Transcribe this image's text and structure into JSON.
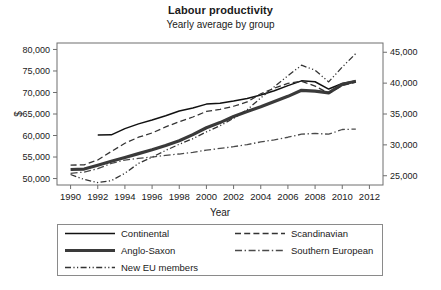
{
  "chart_data": {
    "type": "line",
    "title": "Labour productivity",
    "subtitle": "Yearly average by group",
    "xlabel": "Year",
    "ylabel": "$",
    "grid": false,
    "legend_position": "bottom",
    "xlim": [
      1989,
      2013
    ],
    "xticks": [
      1990,
      1992,
      1994,
      1996,
      1998,
      2000,
      2002,
      2004,
      2006,
      2008,
      2010,
      2012
    ],
    "xtick_labels": [
      "1990",
      "1992",
      "1994",
      "1996",
      "1998",
      "2000",
      "2002",
      "2004",
      "2006",
      "2008",
      "2010",
      "2012"
    ],
    "left_axis": {
      "label": "$",
      "ylim": [
        48500,
        81500
      ],
      "yticks": [
        50000,
        55000,
        60000,
        65000,
        70000,
        75000,
        80000
      ],
      "ytick_labels": [
        "50,000",
        "55,000",
        "60,000",
        "65,000",
        "70,000",
        "75,000",
        "80,000"
      ]
    },
    "right_axis": {
      "ylim": [
        23500,
        46500
      ],
      "yticks": [
        25000,
        30000,
        35000,
        40000,
        45000
      ],
      "ytick_labels": [
        "25,000",
        "30,000",
        "35,000",
        "40,000",
        "45,000"
      ]
    },
    "series": [
      {
        "name": "Continental",
        "axis": "left",
        "style": "solid",
        "width": 1.5,
        "color": "#111111",
        "x": [
          1992,
          1993,
          1994,
          1995,
          1996,
          1997,
          1998,
          1999,
          2000,
          2001,
          2002,
          2003,
          2004,
          2005,
          2006,
          2007,
          2008,
          2009,
          2010,
          2011
        ],
        "values": [
          60100,
          60150,
          61600,
          62700,
          63600,
          64600,
          65700,
          66400,
          67300,
          67500,
          68000,
          68600,
          69400,
          70400,
          71600,
          72700,
          72500,
          70800,
          72100,
          72700
        ]
      },
      {
        "name": "Anglo-Saxon",
        "axis": "left",
        "style": "solid",
        "width": 3.2,
        "color": "#3a3a3a",
        "x": [
          1990,
          1991,
          1992,
          1993,
          1994,
          1995,
          1996,
          1997,
          1998,
          1999,
          2000,
          2001,
          2002,
          2003,
          2004,
          2005,
          2006,
          2007,
          2008,
          2009,
          2010,
          2011
        ],
        "values": [
          52100,
          52200,
          53100,
          54000,
          54900,
          55800,
          56700,
          57700,
          58800,
          60200,
          61800,
          63000,
          64400,
          65600,
          66700,
          67900,
          69100,
          70500,
          70300,
          69900,
          71900,
          72600
        ]
      },
      {
        "name": "New EU members",
        "axis": "right",
        "style": "dash-dot-dot",
        "width": 1.3,
        "color": "#333333",
        "x": [
          1990,
          1991,
          1992,
          1993,
          1994,
          1995,
          1996,
          1997,
          1998,
          1999,
          2000,
          2001,
          2002,
          2003,
          2004,
          2005,
          2006,
          2007,
          2008,
          2009,
          2010,
          2011
        ],
        "values": [
          25200,
          24400,
          23900,
          24200,
          25400,
          27000,
          28000,
          29100,
          30100,
          31000,
          32100,
          33100,
          34300,
          35700,
          37600,
          39400,
          41200,
          42900,
          42100,
          40200,
          42600,
          44800
        ]
      },
      {
        "name": "Scandinavian",
        "axis": "left",
        "style": "dashed",
        "width": 1.3,
        "color": "#333333",
        "x": [
          1990,
          1991,
          1992,
          1993,
          1994,
          1995,
          1996,
          1997,
          1998,
          1999,
          2000,
          2001,
          2002,
          2003,
          2004,
          2005,
          2006,
          2007,
          2008,
          2009,
          2010,
          2011
        ],
        "values": [
          53100,
          53200,
          54300,
          56300,
          58200,
          59600,
          60600,
          62000,
          63200,
          64300,
          65600,
          66100,
          66800,
          67800,
          69700,
          71000,
          72100,
          72600,
          71500,
          69800,
          71600,
          72400
        ]
      },
      {
        "name": "Southern European",
        "axis": "left",
        "style": "dash-dot",
        "width": 1.3,
        "color": "#4a4a4a",
        "x": [
          1990,
          1991,
          1992,
          1993,
          1994,
          1995,
          1996,
          1997,
          1998,
          1999,
          2000,
          2001,
          2002,
          2003,
          2004,
          2005,
          2006,
          2007,
          2008,
          2009,
          2010,
          2011
        ],
        "values": [
          51200,
          51500,
          52300,
          53500,
          54300,
          54700,
          55000,
          55400,
          55700,
          56100,
          56600,
          57000,
          57400,
          57900,
          58500,
          59000,
          59600,
          60300,
          60500,
          60300,
          61400,
          61500
        ]
      }
    ]
  },
  "legend": {
    "entries": [
      {
        "label": "Continental",
        "style": "solid",
        "width": 1.5,
        "color": "#111111"
      },
      {
        "label": "Scandinavian",
        "style": "dashed",
        "width": 1.3,
        "color": "#333333"
      },
      {
        "label": "Anglo-Saxon",
        "style": "solid",
        "width": 3.2,
        "color": "#3a3a3a"
      },
      {
        "label": "Southern European",
        "style": "dash-dot",
        "width": 1.3,
        "color": "#4a4a4a"
      },
      {
        "label": "New EU members",
        "style": "dash-dot-dot",
        "width": 1.3,
        "color": "#333333"
      }
    ]
  }
}
